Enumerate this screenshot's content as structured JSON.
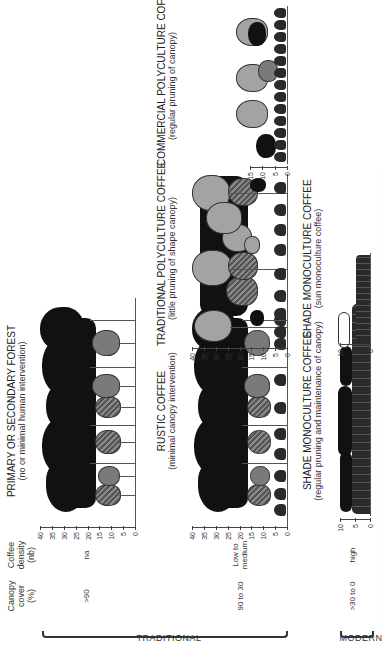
{
  "headers": {
    "canopy_cover": [
      "Canopy",
      "cover",
      "(%)"
    ],
    "coffee_density": [
      "Coffee",
      "density",
      "(nb)"
    ]
  },
  "groups": {
    "traditional": "TRADITIONAL",
    "modern": "MODERN"
  },
  "rows": [
    {
      "canopy_cover": ">90",
      "coffee_density": "na"
    },
    {
      "canopy_cover": "90 to 30",
      "coffee_density": [
        "Low to",
        "medium"
      ]
    },
    {
      "canopy_cover": ">30 to 0",
      "coffee_density": "high"
    }
  ],
  "panels": {
    "primary_forest": {
      "title": "PRIMARY OR SECONDARY FOREST",
      "subtitle": "(no or minimal human intervention)",
      "axis": [
        "40",
        "35",
        "30",
        "25",
        "20",
        "15",
        "10",
        "5",
        "0"
      ]
    },
    "rustic": {
      "title": "RUSTIC COFFEE",
      "subtitle": "(minimal canopy intervention)",
      "axis": [
        "40",
        "35",
        "30",
        "25",
        "20",
        "15",
        "10",
        "5",
        "0"
      ]
    },
    "traditional_polyculture": {
      "title": "TRADITIONAL POLYCULTURE COFFEE",
      "subtitle": "(little pruning of shape canopy)",
      "axis": [
        "40",
        "35",
        "30",
        "25",
        "20",
        "15",
        "10",
        "5",
        "0"
      ]
    },
    "commercial_polyculture": {
      "title": "COMMERCIAL POLYCULTURE COFFEE",
      "subtitle": "(regular pruning of canopy)",
      "axis": [
        "15",
        "10",
        "5",
        "0"
      ]
    },
    "shade_monoculture": {
      "title": "SHADE MONOCULTURE COFFEE",
      "subtitle": "(regular pruning and maintenance of canopy)",
      "axis": [
        "10",
        "5",
        "0"
      ]
    },
    "sun_monoculture": {
      "title": "SHADE MONOCULTURE COFFEE",
      "subtitle": "(sun monoculture coffee)",
      "axis": [
        "10",
        "5",
        "0"
      ]
    }
  },
  "colors": {
    "canopy_dark": "#111111",
    "canopy_mid": "#7a7a7a",
    "canopy_light": "#a3a3a3",
    "coffee": "#2a2a2a"
  }
}
